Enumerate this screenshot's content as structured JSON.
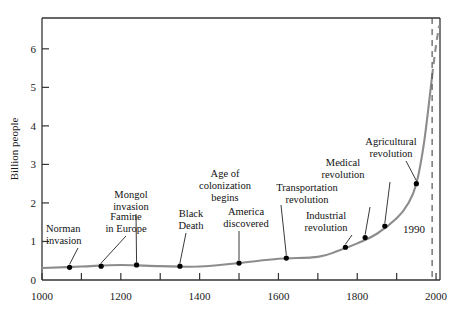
{
  "chart_data": {
    "type": "line",
    "title": "",
    "xlabel": "",
    "ylabel": "Billion people",
    "xlim": [
      1000,
      2010
    ],
    "ylim": [
      0,
      6.8
    ],
    "grid": false,
    "legend": "none",
    "x_major_ticks": [
      1000,
      1200,
      1400,
      1600,
      1800,
      2000
    ],
    "x_major_tick_labels": [
      "1000",
      "1200",
      "1400",
      "1600",
      "1800",
      "2000"
    ],
    "x_minor_ticks": [
      1100,
      1300,
      1500,
      1700,
      1900
    ],
    "y_ticks": [
      0,
      1,
      2,
      3,
      4,
      5,
      6
    ],
    "y_tick_labels": [
      "0",
      "1",
      "2",
      "3",
      "4",
      "5",
      "6"
    ],
    "series": [
      {
        "name": "World population (historical)",
        "style": "solid",
        "color": "#8c8c8c",
        "x": [
          1000,
          1100,
          1200,
          1300,
          1400,
          1500,
          1600,
          1700,
          1750,
          1800,
          1850,
          1900,
          1930,
          1950,
          1970,
          1990
        ],
        "y": [
          0.31,
          0.35,
          0.39,
          0.36,
          0.35,
          0.44,
          0.55,
          0.6,
          0.75,
          0.95,
          1.2,
          1.6,
          2.0,
          2.5,
          3.6,
          5.3
        ]
      },
      {
        "name": "World population (projection)",
        "style": "dashed",
        "color": "#8c8c8c",
        "x": [
          1990,
          2000,
          2008
        ],
        "y": [
          5.3,
          6.1,
          6.6
        ]
      }
    ],
    "markers": [
      {
        "label": "Norman invasion",
        "x": 1070,
        "y": 0.33
      },
      {
        "label": "Famine in Europe",
        "x": 1150,
        "y": 0.36
      },
      {
        "label": "Mongol invasion",
        "x": 1240,
        "y": 0.39
      },
      {
        "label": "Black Death",
        "x": 1350,
        "y": 0.36
      },
      {
        "label": "America discovered",
        "x": 1500,
        "y": 0.44
      },
      {
        "label": "Age of colonization begins",
        "x": 1620,
        "y": 0.57
      },
      {
        "label": "Industrial revolution",
        "x": 1770,
        "y": 0.85
      },
      {
        "label": "Transportation revolution",
        "x": 1820,
        "y": 1.1
      },
      {
        "label": "Medical revolution",
        "x": 1870,
        "y": 1.4
      },
      {
        "label": "Agricultural revolution",
        "x": 1950,
        "y": 2.5
      }
    ],
    "annotations": [
      {
        "label": "1990",
        "x": 1990,
        "type": "vertical-dashed-line"
      }
    ]
  },
  "axes": {
    "y_title": "Billion people"
  },
  "labels": {
    "norman": [
      "Norman",
      "invasion"
    ],
    "famine": [
      "Famine",
      "in Europe"
    ],
    "mongol": [
      "Mongol",
      "invasion"
    ],
    "black_death": [
      "Black",
      "Death"
    ],
    "america": [
      "America",
      "discovered"
    ],
    "colonization": [
      "Age of",
      "colonization",
      "begins"
    ],
    "industrial": [
      "Industrial",
      "revolution"
    ],
    "transportation": [
      "Transportation",
      "revolution"
    ],
    "medical": [
      "Medical",
      "revolution"
    ],
    "agricultural": [
      "Agricultural",
      "revolution"
    ],
    "year_1990": "1990"
  },
  "colors": {
    "curve": "#8c8c8c",
    "axis": "#333333",
    "text": "#111111",
    "marker": "#000000"
  }
}
